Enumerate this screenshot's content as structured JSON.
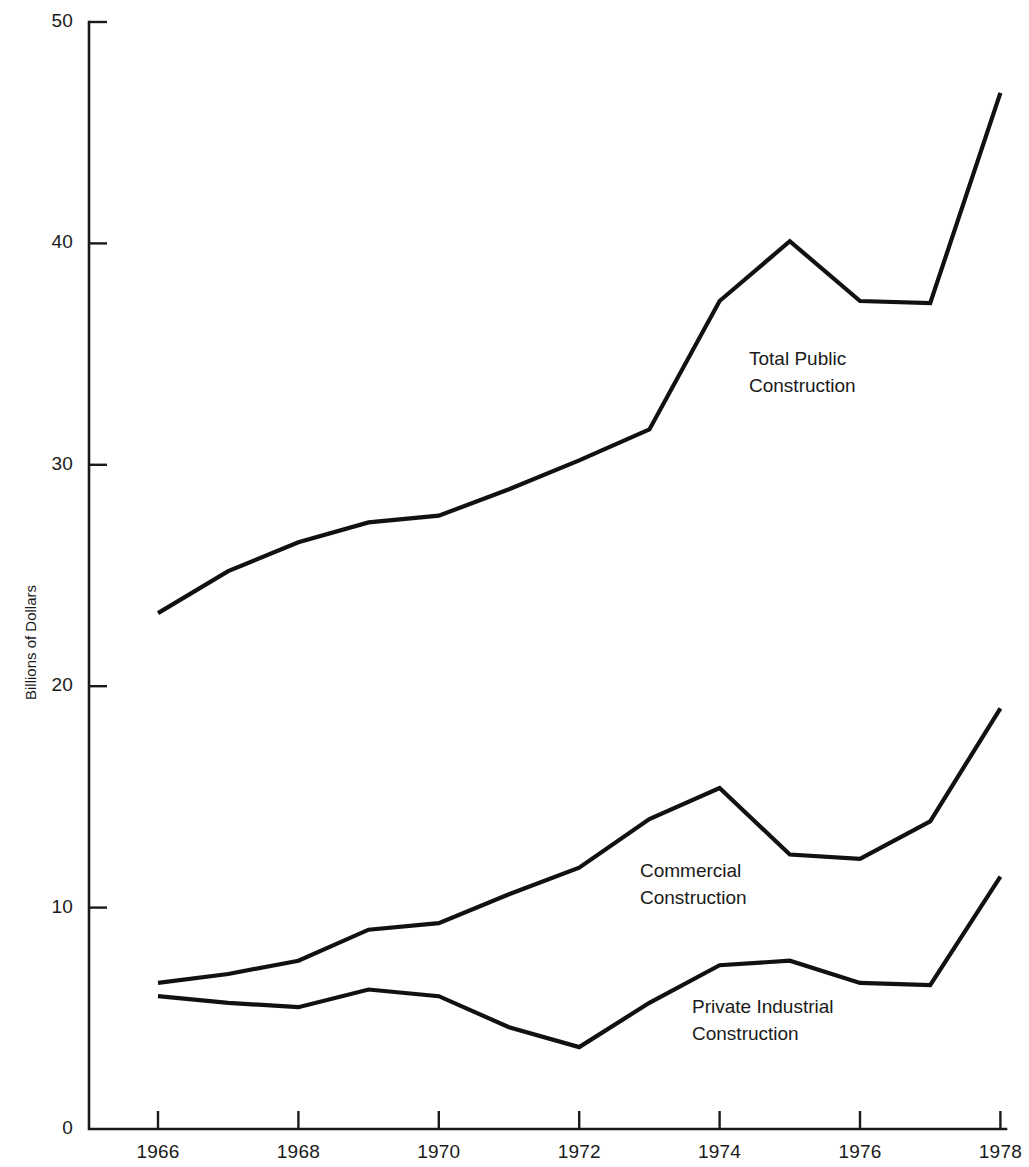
{
  "chart_data": {
    "type": "line",
    "title": "",
    "xlabel": "",
    "ylabel": "Billions of Dollars",
    "x": [
      1966,
      1967,
      1968,
      1969,
      1970,
      1971,
      1972,
      1973,
      1974,
      1975,
      1976,
      1977,
      1978
    ],
    "xlim": [
      1965.3,
      1978.6
    ],
    "ylim": [
      0,
      50
    ],
    "grid": false,
    "legend_position": "inline-annotations",
    "xticks": [
      "1966",
      "1968",
      "1970",
      "1972",
      "1974",
      "1976",
      "1978"
    ],
    "xtick_values": [
      1966,
      1968,
      1970,
      1972,
      1974,
      1976,
      1978
    ],
    "yticks": [
      "0",
      "10",
      "20",
      "30",
      "40",
      "50"
    ],
    "ytick_values": [
      0,
      10,
      20,
      30,
      40,
      50
    ],
    "series": [
      {
        "name": "Total Public Construction",
        "color": "#111111",
        "values": [
          23.3,
          25.2,
          26.5,
          27.4,
          27.7,
          28.9,
          30.2,
          31.6,
          37.4,
          40.1,
          37.4,
          37.3,
          46.8
        ]
      },
      {
        "name": "Commercial Construction",
        "color": "#111111",
        "values": [
          6.6,
          7.0,
          7.6,
          9.0,
          9.3,
          10.6,
          11.8,
          14.0,
          15.4,
          12.4,
          12.2,
          13.9,
          19.0
        ]
      },
      {
        "name": "Private Industrial Construction",
        "color": "#111111",
        "values": [
          6.0,
          5.7,
          5.5,
          6.3,
          6.0,
          4.6,
          3.7,
          5.7,
          7.4,
          7.6,
          6.6,
          6.5,
          11.4
        ]
      }
    ],
    "annotations": [
      {
        "name": "total-public-construction-label",
        "lines": [
          "Total Public",
          "Construction"
        ],
        "x_px": 749,
        "y_px": 345
      },
      {
        "name": "commercial-construction-label",
        "lines": [
          "Commercial",
          "Construction"
        ],
        "x_px": 640,
        "y_px": 857
      },
      {
        "name": "private-industrial-construction-label",
        "lines": [
          "Private Industrial",
          "Construction"
        ],
        "x_px": 692,
        "y_px": 993
      }
    ]
  },
  "axes": {
    "y_axis_title": "Billions of Dollars",
    "y_labels": [
      "50",
      "40",
      "30",
      "20",
      "10",
      "0"
    ],
    "x_labels": [
      "1966",
      "1968",
      "1970",
      "1972",
      "1974",
      "1976",
      "1978"
    ]
  }
}
